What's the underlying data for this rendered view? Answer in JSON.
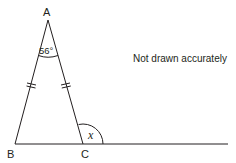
{
  "diagram": {
    "type": "isosceles-triangle-exterior-angle",
    "vertices": {
      "A": {
        "label": "A"
      },
      "B": {
        "label": "B"
      },
      "C": {
        "label": "C"
      }
    },
    "apex_angle": {
      "label": "56°",
      "value": 56,
      "at": "A"
    },
    "exterior_angle": {
      "label": "x",
      "at": "C"
    },
    "equal_sides": [
      "AB",
      "AC"
    ],
    "note": "Not drawn accurately",
    "colors": {
      "stroke": "#231f20",
      "text": "#231f20",
      "background": "#ffffff"
    }
  }
}
